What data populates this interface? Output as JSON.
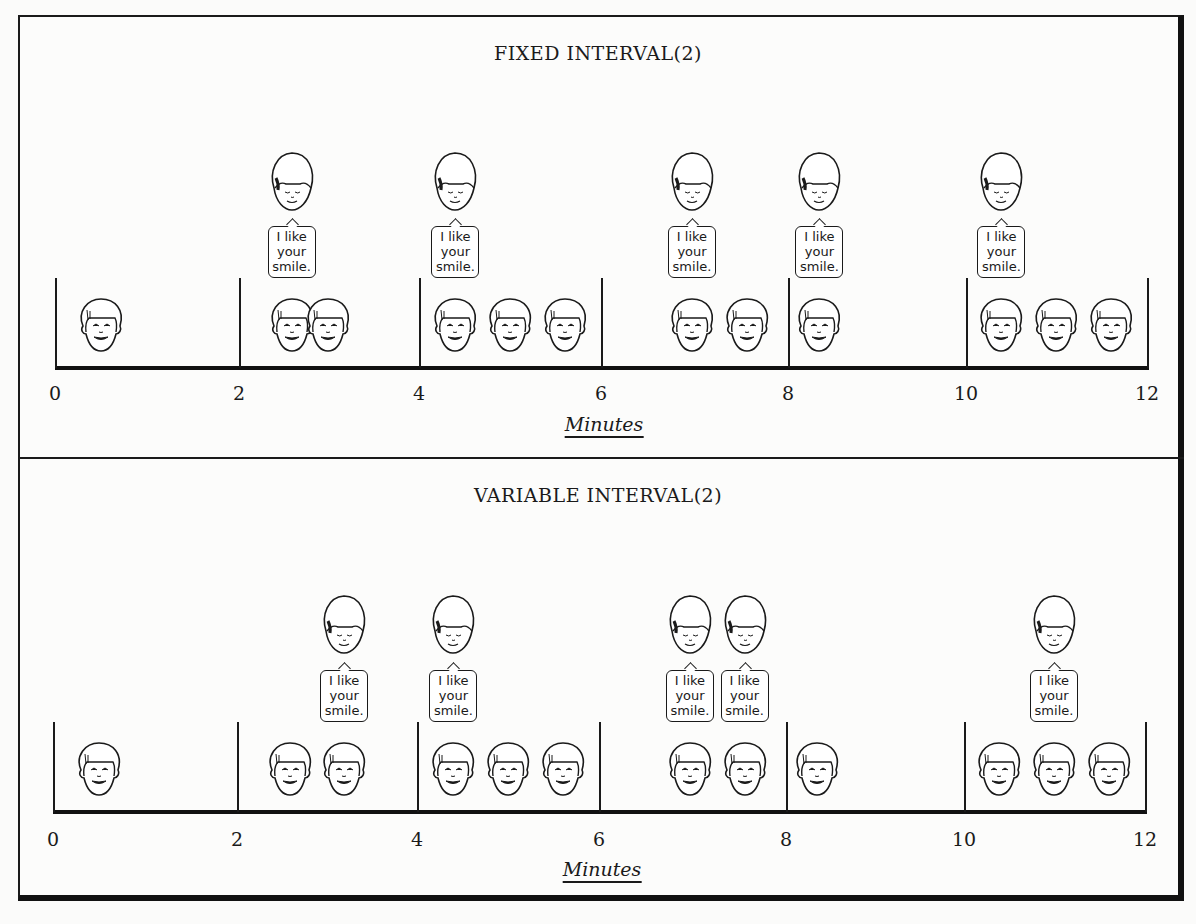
{
  "panels": [
    {
      "title": "FIXED INTERVAL(2)",
      "axis_label": "Minutes",
      "tick_labels": [
        "0",
        "2",
        "4",
        "6",
        "8",
        "10",
        "12"
      ],
      "speech_text": [
        "I like",
        "your",
        "smile."
      ],
      "children_smiling_times_approx": [
        0.5,
        2.6,
        3.0,
        4.4,
        5.0,
        5.6,
        7.0,
        7.6,
        8.4,
        10.4,
        11.0,
        11.6
      ],
      "praise_times_approx": [
        2.6,
        4.4,
        7.0,
        8.4,
        10.4
      ]
    },
    {
      "title": "VARIABLE INTERVAL(2)",
      "axis_label": "Minutes",
      "tick_labels": [
        "0",
        "2",
        "4",
        "6",
        "8",
        "10",
        "12"
      ],
      "speech_text": [
        "I like",
        "your",
        "smile."
      ],
      "children_smiling_times_approx": [
        0.5,
        2.6,
        3.2,
        4.4,
        5.0,
        5.6,
        7.0,
        7.6,
        8.4,
        10.4,
        11.0,
        11.6
      ],
      "praise_times_approx": [
        3.2,
        4.4,
        7.0,
        7.6,
        11.0
      ]
    }
  ],
  "chart_data": [
    {
      "type": "scatter",
      "title": "FIXED INTERVAL(2)",
      "xlabel": "Minutes",
      "ylabel": "",
      "xlim": [
        0,
        12
      ],
      "xticks": [
        0,
        2,
        4,
        6,
        8,
        10,
        12
      ],
      "series": [
        {
          "name": "child smiles",
          "x": [
            0.5,
            2.6,
            3.0,
            4.4,
            5.0,
            5.6,
            7.0,
            7.6,
            8.4,
            10.4,
            11.0,
            11.6
          ]
        },
        {
          "name": "adult praise: I like your smile.",
          "x": [
            2.6,
            4.4,
            7.0,
            8.4,
            10.4
          ]
        }
      ]
    },
    {
      "type": "scatter",
      "title": "VARIABLE INTERVAL(2)",
      "xlabel": "Minutes",
      "ylabel": "",
      "xlim": [
        0,
        12
      ],
      "xticks": [
        0,
        2,
        4,
        6,
        8,
        10,
        12
      ],
      "series": [
        {
          "name": "child smiles",
          "x": [
            0.5,
            2.6,
            3.2,
            4.4,
            5.0,
            5.6,
            7.0,
            7.6,
            8.4,
            10.4,
            11.0,
            11.6
          ]
        },
        {
          "name": "adult praise: I like your smile.",
          "x": [
            3.2,
            4.4,
            7.0,
            7.6,
            11.0
          ]
        }
      ]
    }
  ]
}
